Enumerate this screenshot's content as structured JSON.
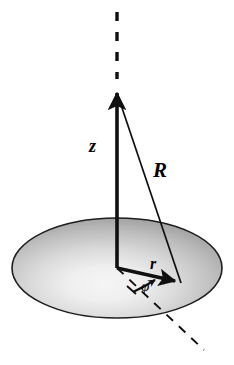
{
  "figure": {
    "name": "cylindrical-coordinates-diagram",
    "background_color": "#ffffff",
    "stroke_color": "#101010",
    "labels": {
      "z_axis": "z",
      "radial_vector": "r",
      "position_vector": "R",
      "azimuth_angle": "φ"
    },
    "disk": {
      "center_x": 117,
      "center_y": 268,
      "radius_x": 105,
      "radius_y": 50,
      "edge_color": "#8e8e8e",
      "highlight_color": "#f2f2f2",
      "outline_color": "#1a1a1a"
    },
    "geometry": {
      "origin_x": 117,
      "origin_y": 268,
      "z_tip_x": 117,
      "z_tip_y": 88,
      "z_dash_top_y": 12,
      "r_tip_x": 181,
      "r_tip_y": 283,
      "phi_dash_end_x": 204,
      "phi_dash_end_y": 350
    }
  }
}
